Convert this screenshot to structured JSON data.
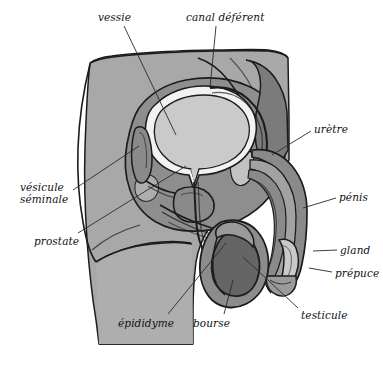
{
  "figure": {
    "language": "fr",
    "background_color": "#ffffff"
  },
  "palette": {
    "body_fill": "#a8a8a8",
    "pelvis_fill": "#8e8e8e",
    "pelvis_dark_fill": "#7b7b7b",
    "bladder_fill": "#cacaca",
    "bladder_rim": "#f2f2f2",
    "testicle_fill": "#656565",
    "scrotum_fill": "#8c8c8c",
    "penis_fill": "#8a8a8a",
    "penis_inner": "#a2a2a2",
    "glans_fill": "#c9c9c9",
    "outline": "#1c1c1c",
    "leader_line": "#2a2a2a",
    "text": "#121212"
  },
  "labels": [
    {
      "id": "vessie",
      "text": "vessie",
      "text2": "",
      "x": 98,
      "y": 12,
      "align": "left"
    },
    {
      "id": "canal-deferent",
      "text": "canal déférent",
      "text2": "",
      "x": 186,
      "y": 12,
      "align": "left"
    },
    {
      "id": "uretre",
      "text": "urètre",
      "text2": "",
      "x": 314,
      "y": 124,
      "align": "left"
    },
    {
      "id": "penis",
      "text": "pénis",
      "text2": "",
      "x": 339,
      "y": 192,
      "align": "left"
    },
    {
      "id": "gland",
      "text": "gland",
      "text2": "",
      "x": 340,
      "y": 245,
      "align": "left"
    },
    {
      "id": "prepuce",
      "text": "prépuce",
      "text2": "",
      "x": 335,
      "y": 268,
      "align": "left"
    },
    {
      "id": "testicule",
      "text": "testicule",
      "text2": "",
      "x": 301,
      "y": 310,
      "align": "left"
    },
    {
      "id": "bourse",
      "text": "bourse",
      "text2": "",
      "x": 193,
      "y": 318,
      "align": "left"
    },
    {
      "id": "epididyme",
      "text": "épididyme",
      "text2": "",
      "x": 118,
      "y": 318,
      "align": "left"
    },
    {
      "id": "prostate",
      "text": "prostate",
      "text2": "",
      "x": 34,
      "y": 236,
      "align": "left"
    },
    {
      "id": "vesicule-seminale",
      "text": "vésicule",
      "text2": "séminale",
      "x": 20,
      "y": 181,
      "align": "left"
    }
  ],
  "leader_lines": [
    {
      "id": "vessie-line",
      "points": "124,26 176,135"
    },
    {
      "id": "canal-deferent-line",
      "points": "216,26 210,88"
    },
    {
      "id": "uretre-line",
      "points": "311,131 272,155"
    },
    {
      "id": "penis-line",
      "points": "336,198 303,208"
    },
    {
      "id": "gland-line",
      "points": "337,250 313,251"
    },
    {
      "id": "prepuce-line",
      "points": "332,272 309,268"
    },
    {
      "id": "testicule-line",
      "points": "298,308 243,257"
    },
    {
      "id": "bourse-line",
      "points": "224,314 233,280"
    },
    {
      "id": "epididyme-line",
      "points": "168,314 226,243"
    },
    {
      "id": "prostate-line",
      "points": "78,233 186,166"
    },
    {
      "id": "vesicule-seminale-line",
      "points": "73,190 139,146"
    }
  ],
  "structures": [
    {
      "id": "body-silhouette",
      "name": "body-silhouette"
    },
    {
      "id": "pelvic-cavity",
      "name": "pelvic-cavity"
    },
    {
      "id": "bladder",
      "name": "bladder"
    },
    {
      "id": "prostate-gland",
      "name": "prostate-gland"
    },
    {
      "id": "seminal-vesicle",
      "name": "seminal-vesicle"
    },
    {
      "id": "vas-deferens",
      "name": "vas-deferens"
    },
    {
      "id": "urethra-tube",
      "name": "urethra-tube"
    },
    {
      "id": "penis-shaft",
      "name": "penis-shaft"
    },
    {
      "id": "glans-penis",
      "name": "glans-penis"
    },
    {
      "id": "prepuce-fold",
      "name": "prepuce-fold"
    },
    {
      "id": "scrotum",
      "name": "scrotum"
    },
    {
      "id": "testicle",
      "name": "testicle"
    },
    {
      "id": "epididymis",
      "name": "epididymis"
    }
  ]
}
